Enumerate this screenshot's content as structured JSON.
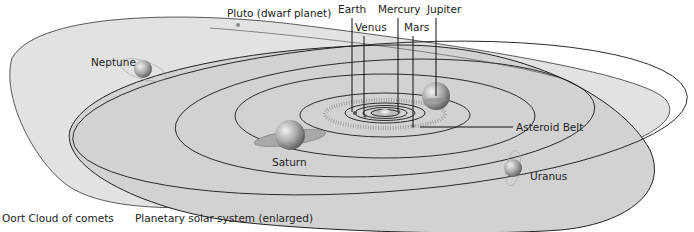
{
  "diagram": {
    "labels": {
      "pluto": "Pluto (dwarf planet)",
      "earth": "Earth",
      "venus": "Venus",
      "mercury": "Mercury",
      "mars": "Mars",
      "jupiter": "Jupiter",
      "neptune": "Neptune",
      "saturn": "Saturn",
      "uranus": "Uranus",
      "asteroid_belt": "Asteroid Belt"
    },
    "captions": {
      "oort_cloud": "Oort Cloud of comets",
      "planetary": "Planetary solar system (enlarged)"
    },
    "colors": {
      "plane_fill": "#dcdcdc",
      "plane_fill_dark": "#cfcfcf",
      "orbit_line": "#1a1a1a",
      "planet": "#9a9a9a"
    }
  }
}
